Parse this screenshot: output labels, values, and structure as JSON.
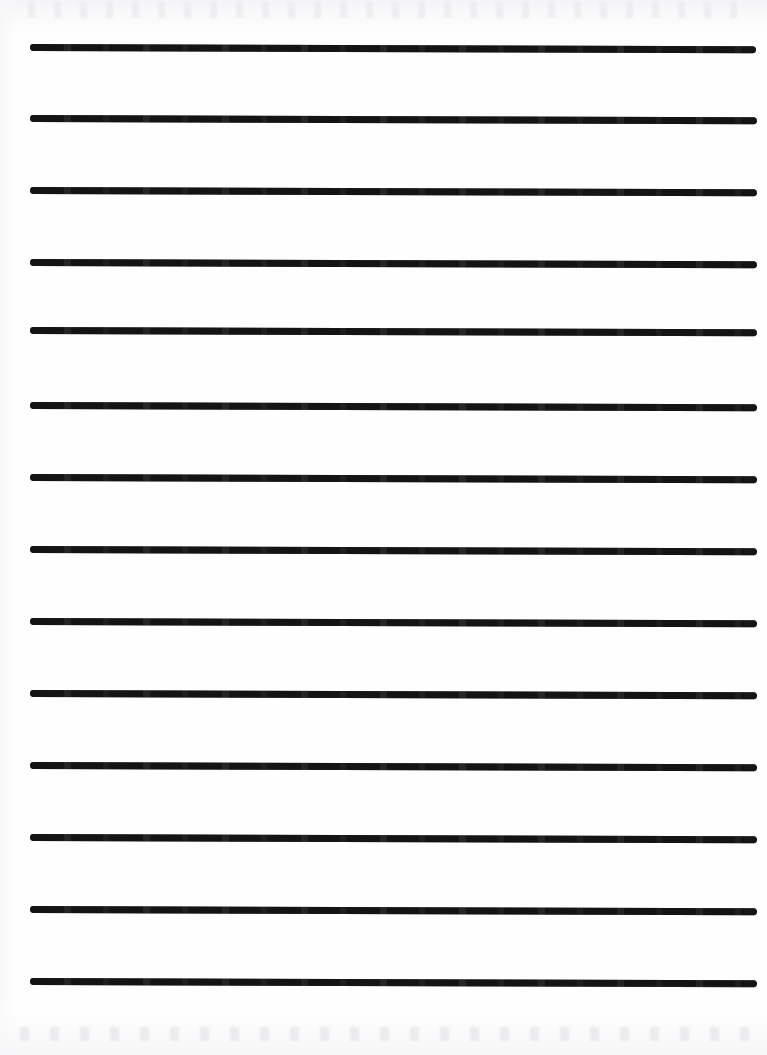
{
  "document": {
    "kind": "ruled-practice-paper-scan",
    "title": "Blank Ruled Handwriting Paper",
    "page_width": 767,
    "page_height": 1055,
    "background_color": "#fefefe",
    "visible_text": "",
    "annotations": []
  },
  "rules": {
    "count": 13,
    "color": "#141414",
    "thickness": 7,
    "cap": "rounded",
    "left_x": 30,
    "right_x": 757,
    "length": 727,
    "spacing": 72,
    "skew_degrees": 0.18,
    "lines": [
      {
        "index": 1,
        "y": 47,
        "left_x": 30,
        "right_x": 756,
        "thickness": 7
      },
      {
        "index": 2,
        "y": 118,
        "left_x": 30,
        "right_x": 757,
        "thickness": 7
      },
      {
        "index": 3,
        "y": 190,
        "left_x": 30,
        "right_x": 757,
        "thickness": 7
      },
      {
        "index": 4,
        "y": 262,
        "left_x": 30,
        "right_x": 757,
        "thickness": 7
      },
      {
        "index": 5,
        "y": 330,
        "left_x": 30,
        "right_x": 757,
        "thickness": 7
      },
      {
        "index": 6,
        "y": 405,
        "left_x": 30,
        "right_x": 757,
        "thickness": 7
      },
      {
        "index": 7,
        "y": 477,
        "left_x": 30,
        "right_x": 757,
        "thickness": 7
      },
      {
        "index": 8,
        "y": 549,
        "left_x": 30,
        "right_x": 757,
        "thickness": 7
      },
      {
        "index": 9,
        "y": 621,
        "left_x": 30,
        "right_x": 757,
        "thickness": 7
      },
      {
        "index": 10,
        "y": 693,
        "left_x": 30,
        "right_x": 757,
        "thickness": 7
      },
      {
        "index": 11,
        "y": 765,
        "left_x": 30,
        "right_x": 757,
        "thickness": 7
      },
      {
        "index": 12,
        "y": 837,
        "left_x": 30,
        "right_x": 757,
        "thickness": 7
      },
      {
        "index": 13,
        "y": 909,
        "left_x": 30,
        "right_x": 757,
        "thickness": 7
      },
      {
        "index": 14,
        "y": 981,
        "left_x": 30,
        "right_x": 757,
        "thickness": 7
      }
    ]
  },
  "scan_artifacts": {
    "top_band": {
      "y": 0,
      "height": 46,
      "tint": "#f4f4f6"
    },
    "bottom_band": {
      "y": 985,
      "height": 70,
      "tint": "#f6f6f8"
    },
    "left_edge": {
      "x": 0,
      "width": 16,
      "tint": "#f7f7f9"
    }
  }
}
